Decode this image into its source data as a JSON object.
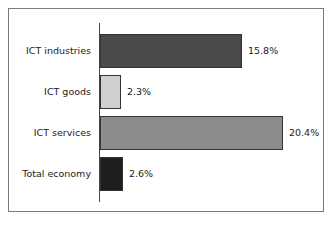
{
  "chart_data": {
    "type": "bar",
    "orientation": "horizontal",
    "title": "",
    "xlabel": "",
    "ylabel": "",
    "categories": [
      "ICT industries",
      "ICT goods",
      "ICT services",
      "Total economy"
    ],
    "values": [
      15.8,
      2.3,
      20.4,
      2.6
    ],
    "value_labels": [
      "15.8%",
      "2.3%",
      "20.4%",
      "2.6%"
    ],
    "colors": [
      "#4a4a4a",
      "#d0d0d0",
      "#8c8c8c",
      "#1e1e1e"
    ],
    "xlim": [
      0,
      22
    ],
    "grid": false,
    "legend": null
  }
}
